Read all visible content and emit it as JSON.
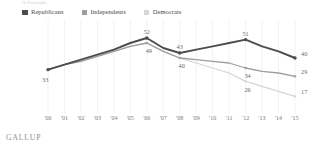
{
  "top_note": "% Favorable",
  "legend": {
    "items": [
      {
        "label": "Republicans",
        "color": "#4d4d4d",
        "key": "republicans"
      },
      {
        "label": "Independents",
        "color": "#9e9e9e",
        "key": "independents"
      },
      {
        "label": "Democrats",
        "color": "#d6d6d6",
        "key": "democrats"
      }
    ]
  },
  "source": "GALLUP",
  "chart_data": {
    "type": "line",
    "title": "",
    "subtitle": "",
    "xlabel": "",
    "ylabel": "",
    "ylim": [
      10,
      58
    ],
    "grid": "vertical",
    "legend_position": "top-left",
    "x": [
      "'00",
      "'01",
      "'02",
      "'03",
      "'04",
      "'05",
      "'06",
      "'07",
      "'08",
      "'09",
      "'10",
      "'11",
      "'12",
      "'13",
      "'14",
      "'15"
    ],
    "series": [
      {
        "name": "Republicans",
        "color": "#4d4d4d",
        "values": [
          33,
          36,
          39,
          42,
          45,
          49,
          52,
          46,
          43,
          45,
          47,
          49,
          51,
          47,
          44,
          40
        ],
        "labeled_points": [
          {
            "x": "'00",
            "value": 33
          },
          {
            "x": "'06",
            "value": 52
          },
          {
            "x": "'08",
            "value": 43
          },
          {
            "x": "'12",
            "value": 51
          },
          {
            "x": "'15",
            "value": 40
          }
        ]
      },
      {
        "name": "Independents",
        "color": "#9e9e9e",
        "values": [
          33,
          36,
          38,
          41,
          44,
          47,
          49,
          44,
          40,
          39,
          38,
          37,
          34,
          32,
          31,
          29
        ],
        "labeled_points": [
          {
            "x": "'06",
            "value": 49
          },
          {
            "x": "'08",
            "value": 40
          },
          {
            "x": "'12",
            "value": 34
          },
          {
            "x": "'15",
            "value": 29
          }
        ]
      },
      {
        "name": "Democrats",
        "color": "#d6d6d6",
        "values": [
          33,
          36,
          38,
          41,
          44,
          47,
          49,
          44,
          40,
          37,
          34,
          31,
          26,
          23,
          20,
          17
        ],
        "labeled_points": [
          {
            "x": "'12",
            "value": 26
          },
          {
            "x": "'15",
            "value": 17
          }
        ]
      }
    ],
    "data_labels": [
      "33",
      "52",
      "49",
      "43",
      "40",
      "51",
      "34",
      "26",
      "40",
      "29",
      "17"
    ]
  }
}
